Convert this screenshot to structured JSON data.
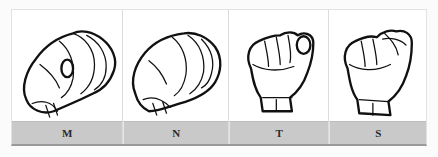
{
  "figure": {
    "title": "",
    "panels": [
      {
        "letter": "M",
        "icon": "asl-handshape-m-icon"
      },
      {
        "letter": "N",
        "icon": "asl-handshape-n-icon"
      },
      {
        "letter": "T",
        "icon": "asl-handshape-t-icon"
      },
      {
        "letter": "S",
        "icon": "asl-handshape-s-icon"
      }
    ],
    "colors": {
      "label_bar": "#c9c9c9",
      "panel_bg": "#ffffff",
      "line_art": "#111111"
    }
  }
}
